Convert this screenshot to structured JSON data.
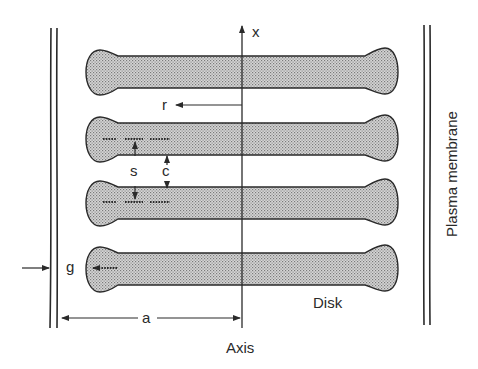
{
  "labels": {
    "x_axis": "x",
    "r": "r",
    "s": "s",
    "c": "c",
    "g": "g",
    "a": "a",
    "axis": "Axis",
    "disk": "Disk",
    "plasma_membrane": "Plasma membrane"
  },
  "colors": {
    "ink": "#2a2a2a",
    "disk_fill": "#bdbdbd",
    "background": "#ffffff"
  },
  "disks": [
    {
      "id": 1,
      "top": 50,
      "bottom": 94
    },
    {
      "id": 2,
      "top": 117,
      "bottom": 161
    },
    {
      "id": 3,
      "top": 181,
      "bottom": 225
    },
    {
      "id": 4,
      "top": 247,
      "bottom": 291
    }
  ]
}
